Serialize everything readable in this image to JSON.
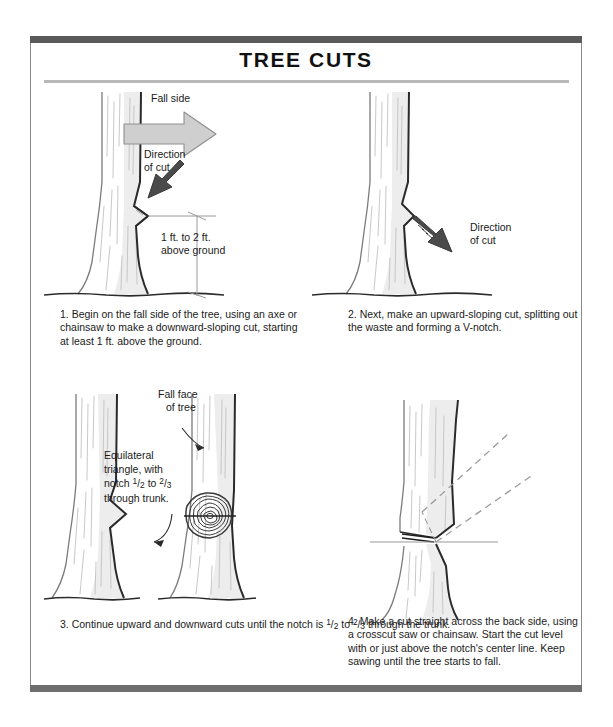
{
  "document": {
    "title": "TREE CUTS"
  },
  "panels": [
    {
      "id": "panel-1",
      "caption": "1. Begin on the fall side of the tree, using an axe or chainsaw to make a downward-sloping cut, starting at least 1 ft. above the ground.",
      "labels": {
        "fall_side": "Fall side",
        "direction_of_cut_line1": "Direction",
        "direction_of_cut_line2": "of cut",
        "dimension_line1": "1 ft. to 2 ft.",
        "dimension_line2": "above ground"
      }
    },
    {
      "id": "panel-2",
      "caption": "2. Next, make an upward-sloping cut, splitting out the waste and forming a V-notch.",
      "labels": {
        "direction_of_cut_line1": "Direction",
        "direction_of_cut_line2": "of cut"
      }
    },
    {
      "id": "panel-3",
      "caption_part1": "3. Continue upward and downward cuts until the notch is ",
      "caption_frac1_num": "1",
      "caption_frac1_den": "2",
      "caption_mid": " to ",
      "caption_frac2_num": "2",
      "caption_frac2_den": "3",
      "caption_part2": " through the trunk.",
      "labels": {
        "fall_face_line1": "Fall face",
        "fall_face_line2": "of tree",
        "equilateral_line1": "Equilateral",
        "equilateral_line2": "triangle, with",
        "equilateral_line3_pre": "notch ",
        "equilateral_frac1_num": "1",
        "equilateral_frac1_den": "2",
        "equilateral_line3_mid": " to ",
        "equilateral_frac2_num": "2",
        "equilateral_frac2_den": "3",
        "equilateral_line4": "through trunk."
      }
    },
    {
      "id": "panel-4",
      "caption": "4. Make a cut straight across the back side, using a crosscut saw or chainsaw. Start the cut level with or just above the notch's center line. Keep sawing until the tree starts to fall.",
      "labels": {}
    }
  ],
  "colors": {
    "frame_bar": "#5a5a5a",
    "frame_side": "#8a8a8a",
    "title_rule": "#b8b8b8",
    "arrow_fill_light": "#cfcfcf",
    "arrow_fill_dark": "#4a4a4a",
    "trunk_shade": "#ededed",
    "bark_line": "#b9b9b9",
    "outline": "#2a2a2a",
    "text": "#1a1a1a",
    "dashed_guide": "#9a9a9a"
  }
}
